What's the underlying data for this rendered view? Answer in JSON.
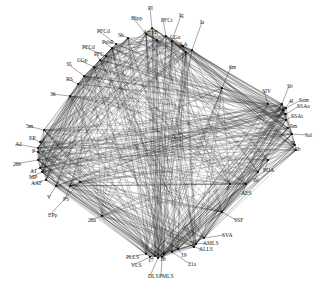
{
  "diagram": {
    "type": "network",
    "nodes": [
      {
        "id": "PI",
        "x": 152,
        "y": 28,
        "lx": 148,
        "ly": 10,
        "anchor": "start"
      },
      {
        "id": "Hipp",
        "x": 146,
        "y": 34,
        "lx": 131,
        "ly": 20,
        "anchor": "start"
      },
      {
        "id": "PFCr",
        "x": 166,
        "y": 36,
        "lx": 161,
        "ly": 22,
        "anchor": "start"
      },
      {
        "id": "Ig",
        "x": 172,
        "y": 41,
        "lx": 179,
        "ly": 17,
        "anchor": "start"
      },
      {
        "id": "AmyB",
        "x": 157,
        "y": 40,
        "lx": 143,
        "ly": 34,
        "anchor": "start"
      },
      {
        "id": "Ia",
        "x": 192,
        "y": 50,
        "lx": 200,
        "ly": 24,
        "anchor": "start"
      },
      {
        "id": "CGa",
        "x": 183,
        "y": 46,
        "lx": 170,
        "ly": 39,
        "anchor": "start"
      },
      {
        "id": "LA",
        "x": 186,
        "y": 52,
        "lx": 180,
        "ly": 46,
        "anchor": "start"
      },
      {
        "id": "Sb",
        "x": 128,
        "y": 38,
        "lx": 118,
        "ly": 37,
        "anchor": "start"
      },
      {
        "id": "PFCd",
        "x": 116,
        "y": 44,
        "lx": 97,
        "ly": 33,
        "anchor": "start"
      },
      {
        "id": "PsbR",
        "x": 112,
        "y": 48,
        "lx": 102,
        "ly": 44,
        "anchor": "start"
      },
      {
        "id": "PFCd2",
        "label": "PFCd",
        "x": 106,
        "y": 56,
        "lx": 82,
        "ly": 49,
        "anchor": "start"
      },
      {
        "id": "PFC",
        "x": 100,
        "y": 60,
        "lx": 94,
        "ly": 56,
        "anchor": "start"
      },
      {
        "id": "CGp",
        "x": 94,
        "y": 67,
        "lx": 77,
        "ly": 62,
        "anchor": "start"
      },
      {
        "id": "35",
        "x": 84,
        "y": 76,
        "lx": 66,
        "ly": 66,
        "anchor": "start"
      },
      {
        "id": "RS",
        "x": 78,
        "y": 84,
        "lx": 66,
        "ly": 81,
        "anchor": "start"
      },
      {
        "id": "36",
        "x": 70,
        "y": 96,
        "lx": 50,
        "ly": 96,
        "anchor": "start"
      },
      {
        "id": "5m",
        "x": 44,
        "y": 130,
        "lx": 26,
        "ly": 128,
        "anchor": "start"
      },
      {
        "id": "EP",
        "x": 40,
        "y": 142,
        "lx": 29,
        "ly": 140,
        "anchor": "start"
      },
      {
        "id": "A2",
        "x": 38,
        "y": 148,
        "lx": 15,
        "ly": 146,
        "anchor": "start"
      },
      {
        "id": "P",
        "x": 38,
        "y": 152,
        "lx": 32,
        "ly": 153,
        "anchor": "start"
      },
      {
        "id": "20b",
        "x": 38,
        "y": 160,
        "lx": 13,
        "ly": 166,
        "anchor": "start"
      },
      {
        "id": "A1",
        "x": 40,
        "y": 168,
        "lx": 30,
        "ly": 173,
        "anchor": "start"
      },
      {
        "id": "MP",
        "x": 42,
        "y": 172,
        "lx": 29,
        "ly": 179,
        "anchor": "start"
      },
      {
        "id": "AAF",
        "x": 46,
        "y": 180,
        "lx": 31,
        "ly": 185,
        "anchor": "start"
      },
      {
        "id": "V",
        "x": 56,
        "y": 186,
        "lx": 47,
        "ly": 199,
        "anchor": "start"
      },
      {
        "id": "PS",
        "x": 70,
        "y": 186,
        "lx": 63,
        "ly": 201,
        "anchor": "start"
      },
      {
        "id": "EPp",
        "x": 80,
        "y": 182,
        "lx": 48,
        "ly": 217,
        "anchor": "start"
      },
      {
        "id": "20a",
        "x": 102,
        "y": 216,
        "lx": 88,
        "ly": 222,
        "anchor": "start"
      },
      {
        "id": "PLLS",
        "x": 146,
        "y": 254,
        "lx": 126,
        "ly": 259,
        "anchor": "start"
      },
      {
        "id": "VLS",
        "x": 150,
        "y": 257,
        "lx": 131,
        "ly": 267,
        "anchor": "start"
      },
      {
        "id": "17",
        "x": 155,
        "y": 256,
        "lx": 148,
        "ly": 262,
        "anchor": "start"
      },
      {
        "id": "DLS",
        "x": 158,
        "y": 258,
        "lx": 148,
        "ly": 278,
        "anchor": "start"
      },
      {
        "id": "PMLS",
        "x": 162,
        "y": 257,
        "lx": 159,
        "ly": 278,
        "anchor": "start"
      },
      {
        "id": "18",
        "x": 164,
        "y": 254,
        "lx": 160,
        "ly": 261,
        "anchor": "start"
      },
      {
        "id": "19",
        "x": 178,
        "y": 249,
        "lx": 181,
        "ly": 257,
        "anchor": "start"
      },
      {
        "id": "21a",
        "x": 172,
        "y": 252,
        "lx": 188,
        "ly": 266,
        "anchor": "start"
      },
      {
        "id": "ALLS",
        "x": 194,
        "y": 247,
        "lx": 199,
        "ly": 251,
        "anchor": "start"
      },
      {
        "id": "AMLS",
        "x": 196,
        "y": 244,
        "lx": 203,
        "ly": 245,
        "anchor": "start"
      },
      {
        "id": "SVA",
        "x": 204,
        "y": 238,
        "lx": 222,
        "ly": 237,
        "anchor": "start"
      },
      {
        "id": "SSF",
        "x": 222,
        "y": 212,
        "lx": 234,
        "ly": 222,
        "anchor": "start"
      },
      {
        "id": "2",
        "x": 230,
        "y": 184,
        "lx": 226,
        "ly": 190,
        "anchor": "start"
      },
      {
        "id": "AES",
        "x": 246,
        "y": 184,
        "lx": 241,
        "ly": 195,
        "anchor": "start"
      },
      {
        "id": "Ial",
        "x": 258,
        "y": 172,
        "lx": 253,
        "ly": 182,
        "anchor": "start"
      },
      {
        "id": "POA",
        "x": 268,
        "y": 160,
        "lx": 263,
        "ly": 172,
        "anchor": "start"
      },
      {
        "id": "6m",
        "x": 222,
        "y": 88,
        "lx": 229,
        "ly": 69,
        "anchor": "start"
      },
      {
        "id": "SIV",
        "x": 268,
        "y": 104,
        "lx": 262,
        "ly": 93,
        "anchor": "start"
      },
      {
        "id": "Sb2",
        "label": "Sb",
        "x": 282,
        "y": 104,
        "lx": 287,
        "ly": 88,
        "anchor": "start"
      },
      {
        "id": "4l",
        "x": 283,
        "y": 110,
        "lx": 289,
        "ly": 103,
        "anchor": "start"
      },
      {
        "id": "Sam",
        "x": 286,
        "y": 108,
        "lx": 299,
        "ly": 102,
        "anchor": "start"
      },
      {
        "id": "SSAo",
        "x": 286,
        "y": 114,
        "lx": 297,
        "ly": 108,
        "anchor": "start"
      },
      {
        "id": "SSAi",
        "x": 286,
        "y": 120,
        "lx": 291,
        "ly": 118,
        "anchor": "start"
      },
      {
        "id": "5m2",
        "label": "5m",
        "x": 288,
        "y": 128,
        "lx": 290,
        "ly": 128,
        "anchor": "start"
      },
      {
        "id": "Sal",
        "x": 292,
        "y": 134,
        "lx": 305,
        "ly": 137,
        "anchor": "start"
      },
      {
        "id": "5l",
        "x": 295,
        "y": 145,
        "lx": 291,
        "ly": 145,
        "anchor": "start"
      },
      {
        "id": "5b",
        "x": 296,
        "y": 150,
        "lx": 295,
        "ly": 151,
        "anchor": "start"
      }
    ]
  }
}
